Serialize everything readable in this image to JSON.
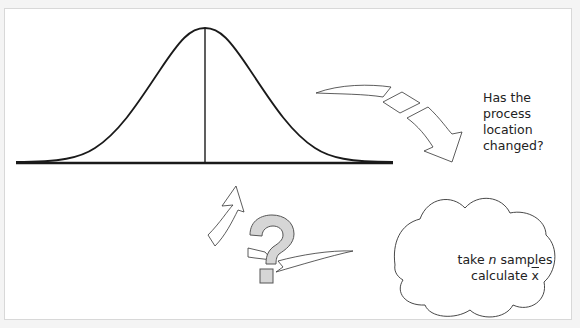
{
  "diagram": {
    "question_text": "Has the process location changed?",
    "question_lines": [
      "Has the",
      "process",
      "location",
      "changed?"
    ],
    "cloud": {
      "line1_prefix": "take ",
      "line1_var": "n",
      "line1_suffix": " samples",
      "line2_prefix": "calculate ",
      "line2_var": "x"
    },
    "elements": [
      "normal-distribution-curve",
      "mean-line",
      "baseline",
      "arrow-to-cloud",
      "cloud",
      "arrow-back-to-curve",
      "question-mark"
    ],
    "colors": {
      "line": "#1a1a1a",
      "question_fill": "#d6d6d6",
      "background": "#ffffff"
    }
  }
}
